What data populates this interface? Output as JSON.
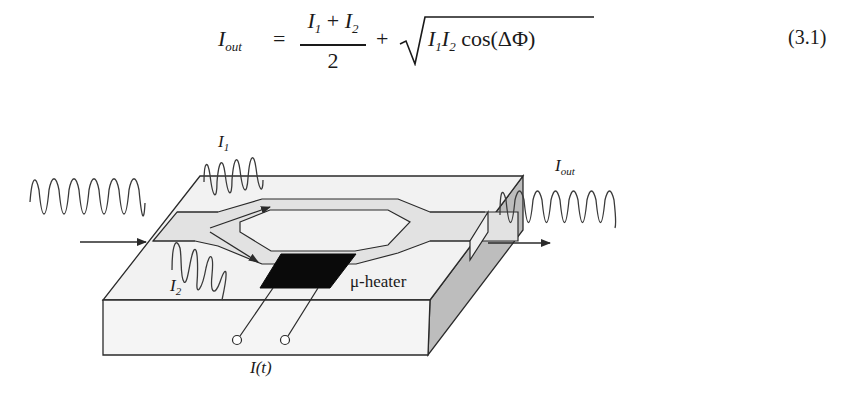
{
  "equation": {
    "lhs_symbol": "I",
    "lhs_subscript": "out",
    "equals": "=",
    "numerator_a": "I",
    "numerator_a_sub": "1",
    "numerator_plus": " + ",
    "numerator_b": "I",
    "numerator_b_sub": "2",
    "denominator": "2",
    "plus": "+",
    "radicand_a": "I",
    "radicand_a_sub": "1",
    "radicand_b": "I",
    "radicand_b_sub": "2",
    "radicand_func": " cos(ΔΦ)",
    "number": "(3.1)"
  },
  "figure": {
    "labels": {
      "i1": {
        "symbol": "I",
        "sub": "1"
      },
      "i2": {
        "symbol": "I",
        "sub": "2"
      },
      "iout": {
        "symbol": "I",
        "sub": "out"
      },
      "heater": "μ-heater",
      "current": "I(t)"
    },
    "colors": {
      "line": "#2a2a2a",
      "slab_top": "#f2f2f2",
      "slab_front": "#f4f4f4",
      "slab_side": "#bdbdbd",
      "waveguide": "#e2e2e2",
      "heater": "#0a0a0a"
    }
  }
}
